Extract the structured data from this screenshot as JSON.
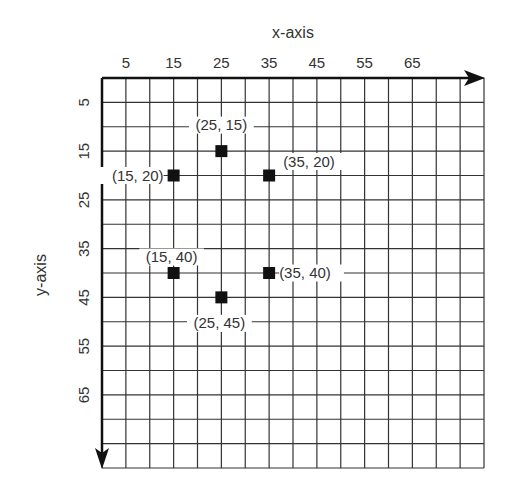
{
  "chart_data": {
    "type": "scatter",
    "title": "",
    "xlabel": "x-axis",
    "ylabel": "y-axis",
    "x_ticks": [
      "5",
      "15",
      "25",
      "35",
      "45",
      "55",
      "65"
    ],
    "y_ticks": [
      "5",
      "15",
      "25",
      "35",
      "45",
      "55",
      "65"
    ],
    "xlim": [
      0,
      80
    ],
    "ylim": [
      0,
      80
    ],
    "y_inverted": true,
    "grid": true,
    "grid_step": 5,
    "points": [
      {
        "x": 25,
        "y": 15,
        "label": "(25, 15)"
      },
      {
        "x": 15,
        "y": 20,
        "label": "(15, 20)"
      },
      {
        "x": 35,
        "y": 20,
        "label": "(35, 20)"
      },
      {
        "x": 15,
        "y": 40,
        "label": "(15, 40)"
      },
      {
        "x": 35,
        "y": 40,
        "label": "(35, 40)"
      },
      {
        "x": 25,
        "y": 45,
        "label": "(25, 45)"
      }
    ],
    "colors": {
      "grid": "#333333",
      "marker": "#111111",
      "text": "#333333"
    }
  }
}
